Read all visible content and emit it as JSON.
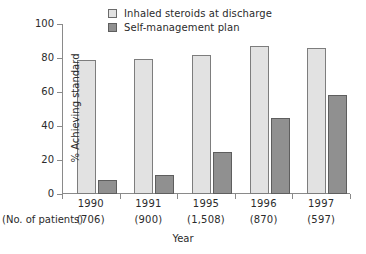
{
  "chart_data": {
    "type": "bar",
    "title": "",
    "subtitle": "",
    "xlabel": "Year",
    "ylabel": "% Achieving standard",
    "ylim": [
      0,
      100
    ],
    "yticks": [
      0,
      20,
      40,
      60,
      80,
      100
    ],
    "ytick_labels": [
      "0",
      "20",
      "40",
      "60",
      "80",
      "100"
    ],
    "grid": false,
    "legend_position": "top-center",
    "categories": [
      "1990",
      "1991",
      "1995",
      "1996",
      "1997"
    ],
    "secondary_axis_label": "(No. of patients)",
    "secondary_categories": [
      "(706)",
      "(900)",
      "(1,508)",
      "(870)",
      "(597)"
    ],
    "series": [
      {
        "name": "Inhaled steroids at discharge",
        "color": "#e2e2e2",
        "border": "#7d7d7d",
        "values": [
          79,
          79.5,
          81.5,
          87,
          86
        ]
      },
      {
        "name": "Self-management plan",
        "color": "#909090",
        "border": "#5e5e5e",
        "values": [
          8.5,
          11,
          25,
          45,
          58
        ]
      }
    ]
  },
  "legend": {
    "items": [
      {
        "label": "Inhaled steroids at discharge",
        "swatch": "light-gray-swatch"
      },
      {
        "label": "Self-management plan",
        "swatch": "dark-gray-swatch"
      }
    ]
  },
  "axes": {
    "y_title": "% Achieving standard",
    "x_title": "Year",
    "patients_row_label": "(No. of patients)"
  }
}
